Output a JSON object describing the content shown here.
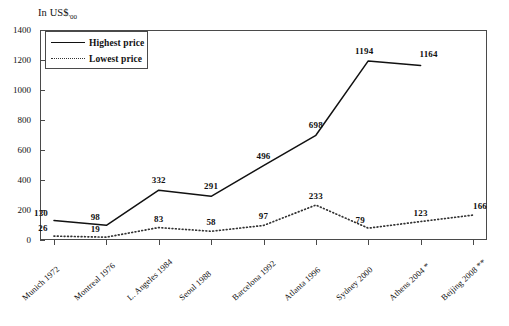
{
  "chart_data": {
    "type": "line",
    "title": "In US$'00",
    "title_main": "In US$",
    "title_sub": "'00",
    "xlabel": "",
    "ylabel": "",
    "ylim": [
      0,
      1400
    ],
    "y_ticks": [
      0,
      200,
      400,
      600,
      800,
      1000,
      1200,
      1400
    ],
    "grid": false,
    "legend_position": "top-left-inside",
    "categories": [
      "Munich 1972",
      "Montreal 1976",
      "L. Angeles 1984",
      "Seoul 1988",
      "Barcelona 1992",
      "Atlanta 1996",
      "Sydney 2000",
      "Athens 2004 *",
      "Beijing 2008 **"
    ],
    "series": [
      {
        "name": "Highest price",
        "style": "solid",
        "values": [
          130,
          98,
          332,
          291,
          496,
          698,
          1194,
          1164,
          null
        ],
        "labels": [
          "130",
          "98",
          "332",
          "291",
          "496",
          "698",
          "1194",
          "1164",
          ""
        ]
      },
      {
        "name": "Lowest price",
        "style": "dotted",
        "values": [
          26,
          19,
          83,
          58,
          97,
          233,
          79,
          123,
          166
        ],
        "labels": [
          "26",
          "19",
          "83",
          "58",
          "97",
          "233",
          "79",
          "123",
          "166"
        ]
      }
    ],
    "colors": {
      "highest": "#111111",
      "lowest": "#333333",
      "axis": "#4a4a4a",
      "background": "#ffffff"
    }
  },
  "legend": {
    "items": [
      {
        "label": "Highest price",
        "style": "solid"
      },
      {
        "label": "Lowest price",
        "style": "dotted"
      }
    ]
  }
}
